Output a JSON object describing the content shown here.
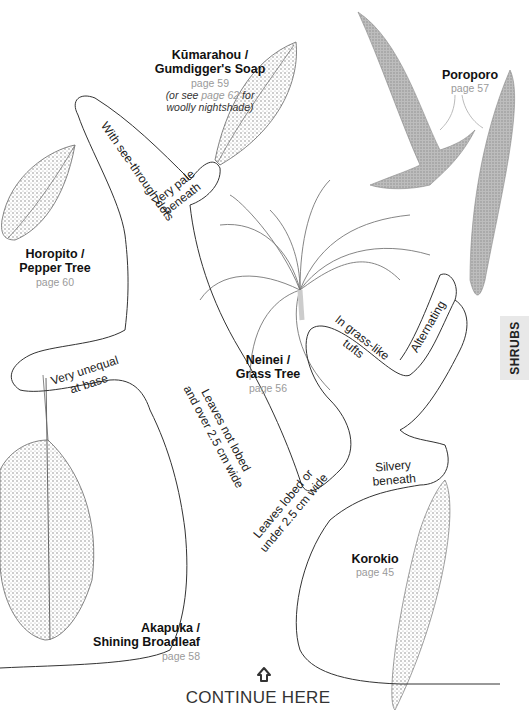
{
  "section_tab": {
    "label": "SHRUBS"
  },
  "plants": [
    {
      "id": "kumarahou",
      "name_line1": "Kūmarahou /",
      "name_line2": "Gumdigger's Soap",
      "page": "page 59",
      "note_pre": "(or see ",
      "note_page": "page 62",
      "note_post": " for",
      "note_line2": "woolly nightshade)"
    },
    {
      "id": "poroporo",
      "name_line1": "Poroporo",
      "page": "page 57"
    },
    {
      "id": "horopito",
      "name_line1": "Horopito /",
      "name_line2": "Pepper Tree",
      "page": "page 60"
    },
    {
      "id": "neinei",
      "name_line1": "Neinei /",
      "name_line2": "Grass Tree",
      "page": "page 56"
    },
    {
      "id": "akapuka",
      "name_line1": "Akapuka /",
      "name_line2": "Shining Broadleaf",
      "page": "page 58"
    },
    {
      "id": "korokio",
      "name_line1": "Korokio",
      "page": "page 45"
    }
  ],
  "key_labels": {
    "see_through": "With see-through dots",
    "very_pale_1": "Very pale",
    "very_pale_2": "beneath",
    "grass_1": "In grass-like",
    "grass_2": "tufts",
    "alternating": "Alternating",
    "unequal_1": "Very unequal",
    "unequal_2": "at base",
    "not_lobed_1": "Leaves not lobed",
    "not_lobed_2": "and over 2.5 cm wide",
    "silvery_1": "Silvery",
    "silvery_2": "beneath",
    "lobed_1": "Leaves lobed or",
    "lobed_2": "under 2.5 cm wide"
  },
  "continue": {
    "icon": "house-up-arrow-icon",
    "label": "CONTINUE HERE"
  },
  "colors": {
    "outline": "#333333",
    "page_ref": "#9a9a9a",
    "tab_bg": "#e8e8e8",
    "leaf_fill": "#b8b8b8"
  }
}
